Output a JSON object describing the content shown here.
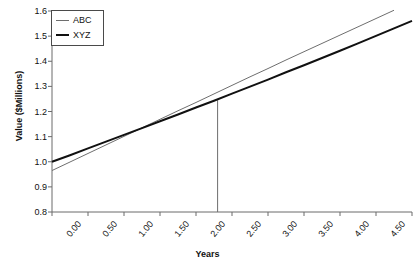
{
  "chart_data": {
    "type": "line",
    "title": "",
    "xlabel": "Years",
    "ylabel": "Value ($Millions)",
    "xlim": [
      0.0,
      5.0
    ],
    "ylim": [
      0.8,
      1.6
    ],
    "xticks": [
      "0.00",
      "0.50",
      "1.00",
      "1.50",
      "2.00",
      "2.50",
      "3.00",
      "3.50",
      "4.00",
      "4.50",
      "5.00"
    ],
    "xtick_values": [
      0.0,
      0.5,
      1.0,
      1.5,
      2.0,
      2.5,
      3.0,
      3.5,
      4.0,
      4.5,
      5.0
    ],
    "yticks": [
      "0.8",
      "0.9",
      "1.0",
      "1.1",
      "1.2",
      "1.3",
      "1.4",
      "1.5",
      "1.6"
    ],
    "ytick_values": [
      0.8,
      0.9,
      1.0,
      1.1,
      1.2,
      1.3,
      1.4,
      1.5,
      1.6
    ],
    "grid": false,
    "legend_position": "top-left",
    "series": [
      {
        "name": "ABC",
        "color": "#6e6e6e",
        "width": 1,
        "x": [
          0.0,
          0.25,
          0.5,
          0.75,
          1.0,
          1.25,
          1.5,
          1.75,
          2.0,
          2.25,
          2.5,
          2.75,
          3.0,
          3.25,
          3.5,
          3.75,
          4.0,
          4.25,
          4.5,
          4.75
        ],
        "y": [
          0.965,
          0.999,
          1.033,
          1.067,
          1.101,
          1.135,
          1.169,
          1.203,
          1.236,
          1.27,
          1.304,
          1.338,
          1.371,
          1.405,
          1.438,
          1.471,
          1.504,
          1.537,
          1.57,
          1.603
        ]
      },
      {
        "name": "XYZ",
        "color": "#111111",
        "width": 2,
        "x": [
          0.0,
          0.25,
          0.5,
          0.75,
          1.0,
          1.25,
          1.5,
          1.75,
          2.0,
          2.25,
          2.5,
          2.75,
          3.0,
          3.25,
          3.5,
          3.75,
          4.0,
          4.25,
          4.5,
          4.75,
          5.0
        ],
        "y": [
          1.0,
          1.026,
          1.053,
          1.08,
          1.107,
          1.134,
          1.161,
          1.188,
          1.216,
          1.243,
          1.271,
          1.299,
          1.327,
          1.356,
          1.384,
          1.413,
          1.442,
          1.471,
          1.501,
          1.531,
          1.561
        ]
      }
    ],
    "annotations": [
      {
        "name": "intersection-dropline",
        "type": "vline",
        "x": 2.3,
        "y_top": 1.245,
        "y_bottom": 0.8,
        "color": "#6e6e6e"
      }
    ],
    "title_fragment": "Comparison"
  },
  "legend": {
    "entries": [
      {
        "label": "ABC"
      },
      {
        "label": "XYZ"
      }
    ]
  },
  "axes": {
    "x_title": "Years",
    "y_title": "Value ($Millions)"
  },
  "colors": {
    "abc_line": "#6e6e6e",
    "xyz_line": "#111111",
    "axis": "#6b6b6b",
    "text": "#111111",
    "background": "#ffffff"
  }
}
